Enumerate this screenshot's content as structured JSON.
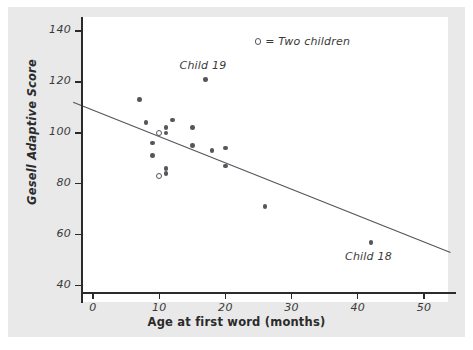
{
  "chart_data": {
    "type": "scatter",
    "title": "",
    "xlabel": "Age at first word (months)",
    "ylabel": "Gesell Adaptive Score",
    "xlim": [
      -3,
      54
    ],
    "ylim": [
      36,
      143
    ],
    "xticks": [
      0,
      10,
      20,
      30,
      40,
      50
    ],
    "yticks": [
      40,
      60,
      80,
      100,
      120,
      140
    ],
    "grid": false,
    "legend_position": "top-right",
    "legend": [
      {
        "marker": "open-circle",
        "label": "= Two children"
      }
    ],
    "points": [
      {
        "x": 7,
        "y": 113,
        "marker": "filled",
        "count": 1
      },
      {
        "x": 8,
        "y": 104,
        "marker": "filled",
        "count": 1
      },
      {
        "x": 9,
        "y": 96,
        "marker": "filled",
        "count": 1
      },
      {
        "x": 9,
        "y": 91,
        "marker": "filled",
        "count": 1
      },
      {
        "x": 10,
        "y": 100,
        "marker": "open",
        "count": 2
      },
      {
        "x": 10,
        "y": 83,
        "marker": "open",
        "count": 2
      },
      {
        "x": 11,
        "y": 102,
        "marker": "filled",
        "count": 1
      },
      {
        "x": 11,
        "y": 100,
        "marker": "filled",
        "count": 1
      },
      {
        "x": 11,
        "y": 86,
        "marker": "filled",
        "count": 1
      },
      {
        "x": 11,
        "y": 84,
        "marker": "filled",
        "count": 1
      },
      {
        "x": 12,
        "y": 105,
        "marker": "filled",
        "count": 1
      },
      {
        "x": 15,
        "y": 102,
        "marker": "filled",
        "count": 1
      },
      {
        "x": 15,
        "y": 95,
        "marker": "filled",
        "count": 1
      },
      {
        "x": 17,
        "y": 121,
        "marker": "filled",
        "count": 1
      },
      {
        "x": 18,
        "y": 93,
        "marker": "filled",
        "count": 1
      },
      {
        "x": 20,
        "y": 94,
        "marker": "filled",
        "count": 1
      },
      {
        "x": 20,
        "y": 87,
        "marker": "filled",
        "count": 1
      },
      {
        "x": 26,
        "y": 71,
        "marker": "filled",
        "count": 1
      },
      {
        "x": 42,
        "y": 57,
        "marker": "filled",
        "count": 1
      }
    ],
    "annotations": [
      {
        "text": "Child 19",
        "x": 17,
        "y": 126
      },
      {
        "text": "Child 18",
        "x": 42,
        "y": 51
      }
    ],
    "regression_line": {
      "x_start": -3,
      "y_start": 112,
      "x_end": 54,
      "y_end": 53,
      "color": "#55555c"
    },
    "colors": {
      "background": "#e9e9e9",
      "plot_background": "#ffffff",
      "axis": "#2b2b2b",
      "marker": "#55555c",
      "text": "#3a3a3a"
    }
  }
}
